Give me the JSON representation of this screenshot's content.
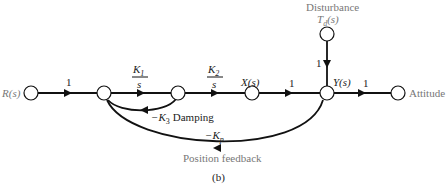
{
  "caption": "(b)",
  "nodes": {
    "input": "R(s)",
    "x": "X(s)",
    "y": "Y(s)",
    "output": "Attitude",
    "disturbance_title": "Disturbance",
    "disturbance_signal": "T_d(s)"
  },
  "branches": {
    "r_to_n1": "1",
    "k1_num": "K",
    "k1_sub": "1",
    "k1_den": "s",
    "k2_num": "K",
    "k2_sub": "2",
    "k2_den": "s",
    "x_to_y": "1",
    "y_to_out": "1",
    "td_to_y": "1",
    "damping_sign": "−K",
    "damping_sub": "3",
    "damping_label": "Damping",
    "feedback_sign": "−K",
    "feedback_sub": "p",
    "feedback_label": "Position feedback"
  },
  "colors": {
    "line": "#111111",
    "label": "#222222",
    "gray_label": "#777777"
  }
}
